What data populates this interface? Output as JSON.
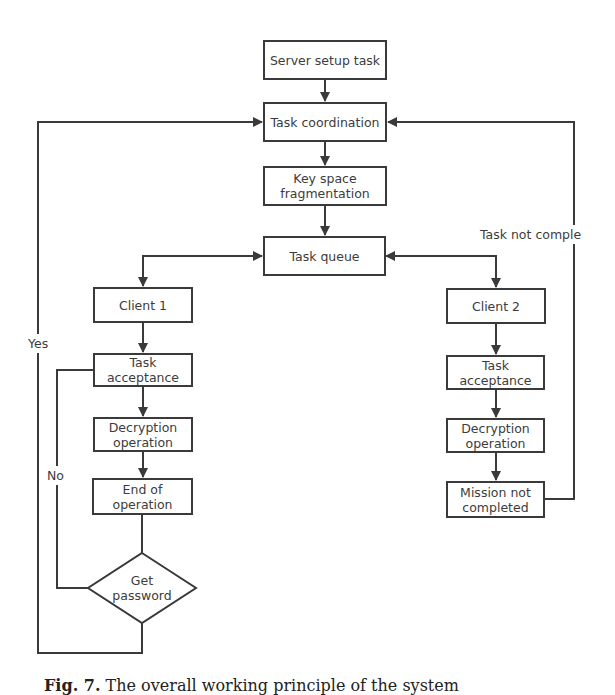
{
  "figure": {
    "caption_label": "Fig. 7.",
    "caption_text": "The overall working principle of the system"
  },
  "nodes": {
    "server_setup": "Server setup task",
    "task_coordination": "Task coordination",
    "key_space": "Key space fragmentation",
    "task_queue": "Task queue",
    "client1": "Client 1",
    "client2": "Client 2",
    "left_task_acceptance": "Task acceptance",
    "left_decryption": "Decryption operation",
    "end_of_operation": "End of operation",
    "get_password": "Get password",
    "right_task_acceptance": "Task acceptance",
    "right_decryption": "Decryption operation",
    "mission_not_completed": "Mission not completed"
  },
  "edge_labels": {
    "yes": "Yes",
    "no": "No",
    "task_not_complete": "Task not comple"
  },
  "colors": {
    "stroke": "#3a3a3a",
    "text": "#3c3c3c",
    "background": "#ffffff"
  }
}
